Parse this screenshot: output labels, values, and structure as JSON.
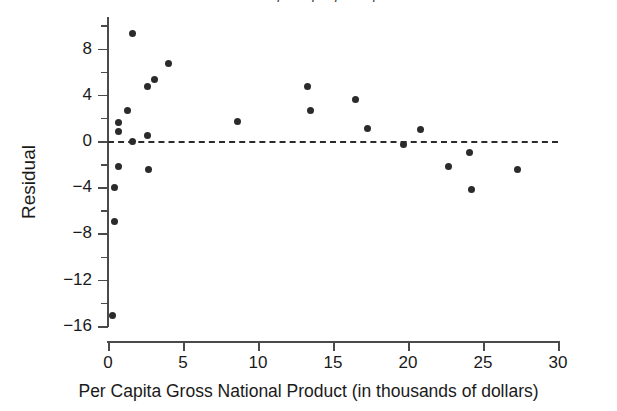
{
  "chart_data": {
    "type": "scatter",
    "title": "Residual plot of ... per capita",
    "xlabel": "Per Capita Gross National Product (in thousands of dollars)",
    "ylabel": "Residual",
    "xlim": [
      0,
      30
    ],
    "ylim": [
      -17.5,
      10.5
    ],
    "xticks": [
      0,
      5,
      10,
      15,
      20,
      25,
      30
    ],
    "xtick_labels": [
      "0",
      "5",
      "10",
      "15",
      "20",
      "25",
      "30"
    ],
    "yticks": [
      8,
      4,
      0,
      -4,
      -8,
      -12,
      -16
    ],
    "ytick_labels": [
      "8",
      "4",
      "0",
      "−4",
      "−8",
      "−12",
      "−16"
    ],
    "y_minor_ticks": [
      10,
      6,
      2,
      -2,
      -6,
      -10,
      -14
    ],
    "grid": false,
    "legend": null,
    "marker_color": "#2b2b2b",
    "marker_size": 7,
    "reference_line": {
      "y": 0,
      "style": "dashed",
      "color": "#2b2b2b"
    },
    "points": [
      {
        "x": 0.3,
        "y": -15.1
      },
      {
        "x": 0.4,
        "y": -7.0
      },
      {
        "x": 0.4,
        "y": -4.0
      },
      {
        "x": 0.7,
        "y": -2.2
      },
      {
        "x": 0.7,
        "y": 0.8
      },
      {
        "x": 0.7,
        "y": 1.6
      },
      {
        "x": 1.3,
        "y": 2.6
      },
      {
        "x": 1.6,
        "y": 0.0
      },
      {
        "x": 1.6,
        "y": 9.3
      },
      {
        "x": 2.6,
        "y": 0.5
      },
      {
        "x": 2.6,
        "y": 4.7
      },
      {
        "x": 2.7,
        "y": -2.5
      },
      {
        "x": 3.1,
        "y": 5.3
      },
      {
        "x": 4.0,
        "y": 6.7
      },
      {
        "x": 8.6,
        "y": 1.7
      },
      {
        "x": 13.3,
        "y": 4.7
      },
      {
        "x": 13.5,
        "y": 2.6
      },
      {
        "x": 16.5,
        "y": 3.6
      },
      {
        "x": 17.3,
        "y": 1.1
      },
      {
        "x": 19.7,
        "y": -0.3
      },
      {
        "x": 20.8,
        "y": 1.0
      },
      {
        "x": 22.7,
        "y": -2.2
      },
      {
        "x": 24.1,
        "y": -1.0
      },
      {
        "x": 24.2,
        "y": -4.2
      },
      {
        "x": 27.3,
        "y": -2.5
      }
    ]
  }
}
